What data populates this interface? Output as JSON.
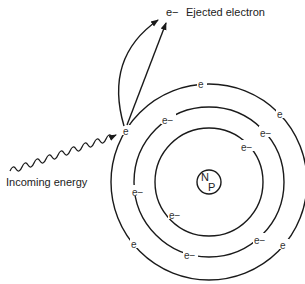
{
  "diagram": {
    "labels": {
      "ejected": "Ejected electron",
      "ejected_symbol": "e−",
      "incoming": "Incoming energy"
    },
    "nucleus": {
      "top": "N",
      "bottom": "P",
      "cx": 209,
      "cy": 182,
      "r": 12
    },
    "shells": [
      {
        "name": "inner",
        "r": 54
      },
      {
        "name": "middle",
        "r": 75
      },
      {
        "name": "outer",
        "r": 98
      }
    ],
    "electrons": {
      "outer_symbol": "e",
      "inner_symbol": "e−",
      "outer": [
        {
          "x": 202,
          "y": 86
        },
        {
          "x": 281,
          "y": 116
        },
        {
          "x": 135,
          "y": 246
        },
        {
          "x": 284,
          "y": 247
        }
      ],
      "middle": [
        {
          "x": 167,
          "y": 122
        },
        {
          "x": 265,
          "y": 135
        },
        {
          "x": 137,
          "y": 194
        },
        {
          "x": 259,
          "y": 242
        },
        {
          "x": 189,
          "y": 257
        }
      ],
      "inner": [
        {
          "x": 246,
          "y": 149
        },
        {
          "x": 174,
          "y": 217
        }
      ],
      "excited": {
        "x": 127,
        "y": 133,
        "symbol": "e"
      }
    },
    "colors": {
      "stroke": "#1a1a1a",
      "text": "#222222",
      "background": "#ffffff"
    }
  }
}
